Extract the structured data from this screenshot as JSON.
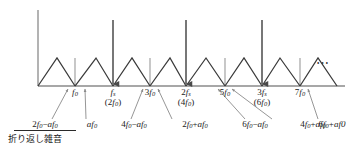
{
  "figure": {
    "type": "spectrum-diagram",
    "baseline_y": 86,
    "axis_x": 38,
    "axis_top_y": 10,
    "peak_y": 58,
    "dots": "⋯",
    "colors": {
      "axis": "#8a8a8a",
      "tick": "#9a9a9a",
      "spectrum": "#3a3a3a",
      "impulse": "#4a4a4a",
      "leader": "#8a8a8a",
      "text": "#1a1a1a"
    },
    "impulses": [
      {
        "name": "fs",
        "x": 113
      },
      {
        "name": "2fs",
        "x": 186
      },
      {
        "name": "3fs",
        "x": 262
      }
    ],
    "triangles": [
      {
        "left": 38,
        "peak": 57,
        "right": 75
      },
      {
        "left": 75,
        "peak": 96,
        "right": 113
      },
      {
        "left": 113,
        "peak": 132,
        "right": 150
      },
      {
        "left": 150,
        "peak": 170,
        "right": 186
      },
      {
        "left": 186,
        "peak": 206,
        "right": 225
      },
      {
        "left": 225,
        "peak": 244,
        "right": 262
      },
      {
        "left": 262,
        "peak": 280,
        "right": 300
      },
      {
        "left": 300,
        "peak": 318,
        "right": 337
      }
    ],
    "ticks": [
      75,
      150,
      225,
      300
    ]
  },
  "axis_labels": [
    {
      "id": "f0",
      "x": 75,
      "line1": "f",
      "sub1": "0",
      "line2": "",
      "sub2": ""
    },
    {
      "id": "fs",
      "x": 113,
      "line1": "f",
      "sub1": "s",
      "line2": "(2f",
      "sub2": "0",
      "close": ")"
    },
    {
      "id": "3f0",
      "x": 150,
      "line1": "3f",
      "sub1": "0",
      "line2": "",
      "sub2": ""
    },
    {
      "id": "2fs",
      "x": 186,
      "line1": "2f",
      "sub1": "s",
      "line2": "(4f",
      "sub2": "0",
      "close": ")"
    },
    {
      "id": "5f0",
      "x": 225,
      "line1": "5f",
      "sub1": "0",
      "line2": "",
      "sub2": ""
    },
    {
      "id": "3fs",
      "x": 262,
      "line1": "3f",
      "sub1": "s",
      "line2": "(6f",
      "sub2": "0",
      "close": ")"
    },
    {
      "id": "7f0",
      "x": 300,
      "line1": "7f",
      "sub1": "0",
      "line2": "",
      "sub2": ""
    }
  ],
  "note_labels": [
    {
      "id": "n1",
      "x": 45,
      "text": "2f₀−af₀",
      "underline": true,
      "target_x": 68,
      "anchor": "center"
    },
    {
      "id": "n2",
      "x": 103,
      "text": "af₀",
      "underline": false,
      "target_x": 85,
      "anchor": "center"
    },
    {
      "id": "n3",
      "x": 143,
      "text": "4f₀−af₀",
      "underline": false,
      "target_x": 143,
      "anchor": "center"
    },
    {
      "id": "n4",
      "x": 203,
      "text": "2f₀+af₀",
      "underline": false,
      "target_x": 158,
      "anchor": "center"
    },
    {
      "id": "n5",
      "x": 258,
      "text": "6f₀−af₀",
      "underline": false,
      "target_x": 218,
      "anchor": "center"
    },
    {
      "id": "n6",
      "x": 309,
      "text": "4f₀+af₀",
      "underline": false,
      "target_x": 232,
      "anchor": "center"
    },
    {
      "id": "n7",
      "x": 330,
      "text": "6f₀+af₀",
      "underline": false,
      "target_x": 308,
      "anchor": "center"
    }
  ],
  "caption": {
    "text": "折り返し雑音",
    "x": 8,
    "y": 136
  },
  "dots_label": "⋯"
}
